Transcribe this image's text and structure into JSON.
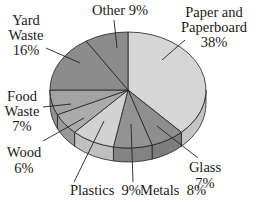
{
  "chart_data": {
    "type": "pie",
    "title": "",
    "style": "3d-pie",
    "start_angle": "12 o'clock",
    "direction": "clockwise",
    "categories": [
      "Paper and Paperboard",
      "Glass",
      "Metals",
      "Plastics",
      "Wood",
      "Food Waste",
      "Yard Waste",
      "Other"
    ],
    "values": [
      38,
      7,
      8,
      9,
      6,
      7,
      16,
      9
    ],
    "unit": "%",
    "colors": [
      "#d6d6d6",
      "#8e8e8e",
      "#939393",
      "#d2d2d2",
      "#ababab",
      "#a3a3a3",
      "#8c8c8c",
      "#8c8c8c"
    ],
    "side_colors": [
      "#c4c4c4",
      "#7d7d7d",
      "#838383",
      "#c0c0c0",
      "#999999",
      "#929292",
      "#7b7b7b",
      "#7b7b7b"
    ],
    "labels": [
      {
        "lines": [
          "Paper and",
          "Paperboard",
          "38%"
        ]
      },
      {
        "lines": [
          "Glass",
          "7%"
        ]
      },
      {
        "lines": [
          "Metals  8%"
        ]
      },
      {
        "lines": [
          "Plastics  9%"
        ]
      },
      {
        "lines": [
          "Wood",
          "6%"
        ]
      },
      {
        "lines": [
          "Food",
          "Waste",
          "7%"
        ]
      },
      {
        "lines": [
          "Yard",
          "Waste",
          "16%"
        ]
      },
      {
        "lines": [
          "Other 9%"
        ]
      }
    ],
    "legend": "none (direct labels with leader lines)"
  }
}
